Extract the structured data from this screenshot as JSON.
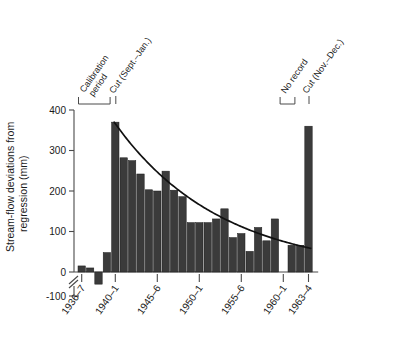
{
  "chart_data": {
    "type": "bar",
    "title": "",
    "xlabel": "",
    "ylabel": "Stream-flow deviations from regression (mm)",
    "ylabel_line1": "Stream-flow deviations from",
    "ylabel_line2": "regression (mm)",
    "ylim": [
      -100,
      400
    ],
    "yticks": [
      -100,
      0,
      100,
      200,
      300,
      400
    ],
    "ytick_labels": [
      "-100",
      "0",
      "100",
      "200",
      "300",
      "400"
    ],
    "axis_break": true,
    "grid": false,
    "legend": "none",
    "xtick_labels": [
      "1936–7",
      "1940–1",
      "1945–6",
      "1950–1",
      "1955–6",
      "1960–1",
      "1963–4"
    ],
    "xtick_years": [
      1936,
      1940,
      1945,
      1950,
      1955,
      1960,
      1963
    ],
    "categories": [
      "1936–7",
      "1937–8",
      "1938–9",
      "1939–40",
      "1940–1",
      "1941–2",
      "1942–3",
      "1943–4",
      "1944–5",
      "1945–6",
      "1946–7",
      "1947–8",
      "1948–9",
      "1949–50",
      "1950–1",
      "1951–2",
      "1952–3",
      "1953–4",
      "1954–5",
      "1955–6",
      "1956–7",
      "1957–8",
      "1958–9",
      "1959–60",
      "1960–1",
      "1961–2",
      "1962–3",
      "1963–4"
    ],
    "values": [
      15,
      10,
      -30,
      48,
      370,
      282,
      275,
      242,
      203,
      200,
      249,
      202,
      186,
      122,
      122,
      122,
      131,
      156,
      85,
      95,
      51,
      110,
      77,
      131,
      null,
      66,
      66,
      360
    ],
    "missing_label": "No record",
    "missing_indices": [
      24
    ],
    "curve": {
      "label": "exponential recovery curve",
      "type": "exponential-decay",
      "start_year": 1940,
      "start_value": 370,
      "end_year": 1963,
      "end_value": 58
    },
    "annotations": [
      {
        "name": "calibration-period",
        "text_line1": "Calibration",
        "text_line2": "period",
        "bracket": true,
        "start_year": 1936,
        "end_year": 1939
      },
      {
        "name": "cut-sept-jan",
        "text_line1": "Cut (Sept.–Jan.)",
        "text_line2": "",
        "bracket": false,
        "start_year": 1940,
        "end_year": 1940
      },
      {
        "name": "no-record",
        "text_line1": "No record",
        "text_line2": "",
        "bracket": true,
        "start_year": 1960,
        "end_year": 1961
      },
      {
        "name": "cut-nov-dec",
        "text_line1": "Cut (Nov.–Dec.)",
        "text_line2": "",
        "bracket": false,
        "start_year": 1963,
        "end_year": 1963
      }
    ],
    "colors": {
      "bar_fill": "#3b3b3b",
      "bar_stroke": "#1c1c1c",
      "curve": "#111111",
      "axis": "#4a4a4a",
      "background": "#ffffff"
    }
  }
}
